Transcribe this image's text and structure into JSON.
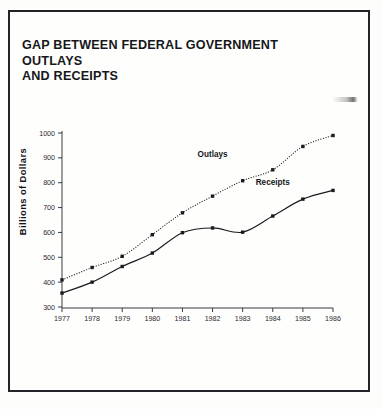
{
  "page": {
    "background_color": "#fdfdfb",
    "frame_color": "#23242a"
  },
  "title": {
    "line1": "GAP BETWEEN FEDERAL GOVERNMENT OUTLAYS",
    "line2": "AND RECEIPTS",
    "full": "GAP BETWEEN FEDERAL GOVERNMENT OUTLAYS AND RECEIPTS"
  },
  "axes": {
    "ylabel": "Billions of Dollars",
    "xlabel": "",
    "yticks": [
      "1000",
      "900",
      "800",
      "700",
      "600",
      "500",
      "400",
      "300"
    ],
    "xticks": [
      "1977",
      "1978",
      "1979",
      "1980",
      "1981",
      "1982",
      "1983",
      "1984",
      "1985",
      "1986"
    ]
  },
  "series_labels": {
    "outlays": "Outlays",
    "receipts": "Receipts"
  },
  "chart_data": {
    "type": "line",
    "title": "GAP BETWEEN FEDERAL GOVERNMENT OUTLAYS AND RECEIPTS",
    "xlabel": "",
    "ylabel": "Billions of Dollars",
    "x": [
      1977,
      1978,
      1979,
      1980,
      1981,
      1982,
      1983,
      1984,
      1985,
      1986
    ],
    "categories": [
      "1977",
      "1978",
      "1979",
      "1980",
      "1981",
      "1982",
      "1983",
      "1984",
      "1985",
      "1986"
    ],
    "xlim": [
      1977,
      1986
    ],
    "ylim": [
      300,
      1000
    ],
    "ytick_step": 100,
    "grid": false,
    "legend": "inline-annotations",
    "series": [
      {
        "name": "Outlays",
        "style": "dotted",
        "color": "#1a1b20",
        "marker": "square",
        "values": [
          409,
          459,
          504,
          591,
          679,
          746,
          808,
          852,
          946,
          990
        ]
      },
      {
        "name": "Receipts",
        "style": "solid",
        "color": "#1a1b20",
        "marker": "square",
        "values": [
          356,
          400,
          463,
          517,
          599,
          618,
          601,
          666,
          734,
          769
        ]
      }
    ],
    "annotations": [
      {
        "text": "Outlays",
        "near_x": 1982,
        "near_y": 905
      },
      {
        "text": "Receipts",
        "near_x": 1984,
        "near_y": 790
      }
    ]
  }
}
